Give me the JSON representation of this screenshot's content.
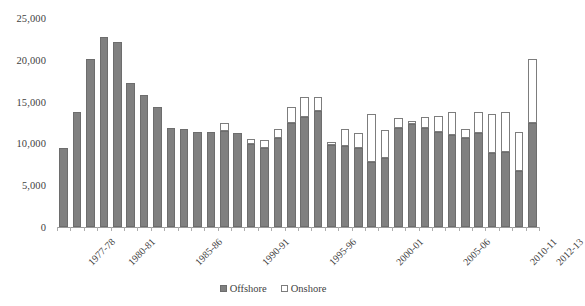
{
  "chart_data": {
    "type": "bar",
    "stacked": true,
    "title": "",
    "subtitle": "",
    "xlabel": "",
    "ylabel": "",
    "ylim": [
      0,
      25000
    ],
    "ytick_step": 5000,
    "ytick_labels": [
      "0",
      "5,000",
      "10,000",
      "15,000",
      "20,000",
      "25,000"
    ],
    "ytick_values": [
      0,
      5000,
      10000,
      15000,
      20000,
      25000
    ],
    "grid": false,
    "legend_position": "bottom",
    "categories": [
      "1977-78",
      "1978-79",
      "1979-80",
      "1980-81",
      "1981-82",
      "1982-83",
      "1983-84",
      "1984-85",
      "1985-86",
      "1986-87",
      "1987-88",
      "1988-89",
      "1989-90",
      "1990-91",
      "1991-92",
      "1992-93",
      "1993-94",
      "1994-95",
      "1995-96",
      "1996-97",
      "1997-98",
      "1998-99",
      "1999-00",
      "2000-01",
      "2001-02",
      "2002-03",
      "2003-04",
      "2004-05",
      "2005-06",
      "2006-07",
      "2007-08",
      "2008-09",
      "2009-10",
      "2010-11",
      "2011-12",
      "2012-13"
    ],
    "tick_labels_shown": [
      "1977-78",
      "1980-81",
      "1985-86",
      "1990-91",
      "1995-96",
      "2000-01",
      "2005-06",
      "2010-11",
      "2012-13"
    ],
    "series": [
      {
        "name": "Offshore",
        "color": "#808080",
        "values": [
          9500,
          13800,
          20100,
          22700,
          22100,
          17200,
          15800,
          14400,
          11900,
          11700,
          11400,
          11400,
          11500,
          11300,
          9900,
          9500,
          10600,
          12500,
          13100,
          13900,
          9800,
          9700,
          9400,
          7800,
          8200,
          11800,
          12300,
          11900,
          11400,
          11000,
          10700,
          11200,
          8900,
          9000,
          6700,
          12500
        ]
      },
      {
        "name": "Onshore",
        "color": "#ffffff",
        "values": [
          0,
          0,
          0,
          0,
          0,
          0,
          0,
          0,
          0,
          0,
          0,
          0,
          1000,
          0,
          600,
          900,
          1100,
          1800,
          2400,
          1600,
          400,
          2000,
          1800,
          5700,
          3400,
          1200,
          400,
          1300,
          1900,
          2800,
          1000,
          2500,
          4600,
          4700,
          4700,
          7600
        ]
      }
    ]
  },
  "legend": {
    "entries": [
      {
        "label": "Offshore",
        "swatch": "filled-square-icon"
      },
      {
        "label": "Onshore",
        "swatch": "hollow-square-icon"
      }
    ]
  }
}
